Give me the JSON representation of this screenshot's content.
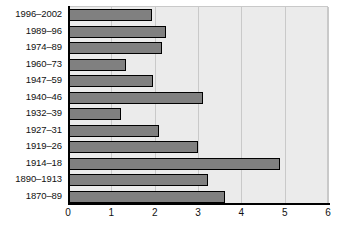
{
  "chart_data": {
    "type": "bar",
    "orientation": "horizontal",
    "title": "",
    "subtitle": "",
    "xlabel": "",
    "ylabel": "",
    "xlim": [
      0,
      6
    ],
    "ylim": null,
    "xticks": [
      0,
      1,
      2,
      3,
      4,
      5,
      6
    ],
    "xticklabels": [
      "0",
      "1",
      "2",
      "3",
      "4",
      "5",
      "6"
    ],
    "grid": "vertical",
    "legend": null,
    "legend_position": "none",
    "annotations": [],
    "series_name": "",
    "bar_color": "#808080",
    "bar_edge_color": "#000000",
    "plot_background": "#ebebeb",
    "gridline_color": "#c9c9c9",
    "axis_color": "#000000",
    "categories": [
      "1996–2002",
      "1989–96",
      "1974–89",
      "1960–73",
      "1947–59",
      "1940–46",
      "1932–39",
      "1927–31",
      "1919–26",
      "1914–18",
      "1890–1913",
      "1870–89"
    ],
    "values": [
      1.93,
      2.27,
      2.18,
      1.33,
      1.96,
      3.11,
      1.22,
      2.09,
      3.0,
      4.89,
      3.24,
      3.62
    ]
  }
}
